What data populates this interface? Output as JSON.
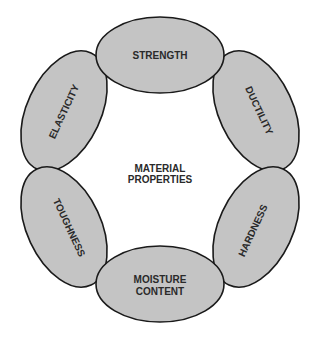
{
  "diagram": {
    "center_label": [
      "MATERIAL",
      "PROPERTIES"
    ],
    "nodes": [
      {
        "label": "STRENGTH"
      },
      {
        "label": "DUCTILITY"
      },
      {
        "label": "HARDNESS"
      },
      {
        "label": "MOISTURE",
        "label2": "CONTENT"
      },
      {
        "label": "TOUGHNESS"
      },
      {
        "label": "ELASTICITY"
      }
    ],
    "colors": {
      "fill": "#c4c4c4",
      "stroke": "#1a1a1a",
      "text": "#2a2a2a"
    }
  }
}
